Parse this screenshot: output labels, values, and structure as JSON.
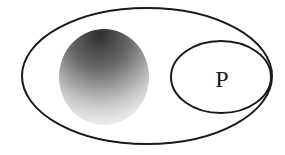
{
  "diagram": {
    "type": "set-diagram",
    "outer_set": {
      "label": "",
      "shape": "ellipse"
    },
    "inner_set": {
      "label": "P",
      "shape": "ellipse",
      "tangent_to_outer": "right"
    },
    "shaded_region": {
      "label": "",
      "shape": "circle",
      "fill": "radial-gradient dark top to light bottom"
    },
    "colors": {
      "stroke": "#1a1a1a",
      "background": "#ffffff",
      "shade_dark": "#3a3a3a",
      "shade_light": "#ffffff"
    }
  }
}
